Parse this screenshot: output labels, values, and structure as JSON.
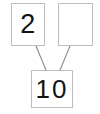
{
  "diagram": {
    "type": "number-bond",
    "colors": {
      "background": "#ffffff",
      "box_border": "#bdbdbd",
      "connector_line": "#8c8c8c",
      "digit": "#141414"
    },
    "parts": [
      {
        "name": "part-left",
        "value": "2",
        "filled": true
      },
      {
        "name": "part-right",
        "value": "",
        "filled": false
      }
    ],
    "whole": {
      "name": "whole",
      "value": "10",
      "filled": true
    },
    "connectors": [
      {
        "name": "connector-left",
        "from": "part-left",
        "to": "whole",
        "x1": 36,
        "y1": 46,
        "x2": 46,
        "y2": 70
      },
      {
        "name": "connector-right",
        "from": "part-right",
        "to": "whole",
        "x1": 70,
        "y1": 46,
        "x2": 60,
        "y2": 70
      }
    ]
  }
}
